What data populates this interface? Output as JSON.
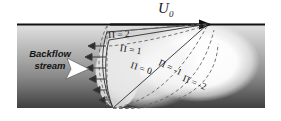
{
  "figure": {
    "kind": "boundary-layer-separation-diagram",
    "width": 281,
    "height": 121,
    "background": "#ffffff"
  },
  "labels": {
    "freestream": {
      "symbol": "U",
      "subscript": "0",
      "text": "U0"
    },
    "backflow": {
      "line1": "Backflow",
      "line2": "stream"
    },
    "profiles": [
      {
        "id": "pi-2",
        "text": "Π = 2"
      },
      {
        "id": "pi-1",
        "text": "Π = 1"
      },
      {
        "id": "pi-0",
        "text": "Π = 0"
      },
      {
        "id": "pi-m1",
        "text": "Π = -1"
      },
      {
        "id": "pi-m2",
        "text": "Π = -2"
      }
    ]
  },
  "colors": {
    "wall_line": "#111111",
    "profile_line": "#2b2b2b",
    "dashed_line": "#6e6e6e",
    "band_top": "#d8d8d8",
    "band_mid": "#9a9a9a",
    "band_bottom": "#4a4a4a",
    "bubble_fill": "#efefef",
    "arrow_white": "#ffffff",
    "text": "#141414"
  },
  "geometry": {
    "apex_point": [
      208,
      24
    ],
    "origin_point": [
      113,
      108
    ],
    "separation_x": 107,
    "wall_line_y": 24,
    "band_rect": [
      17,
      24,
      248,
      84
    ]
  }
}
